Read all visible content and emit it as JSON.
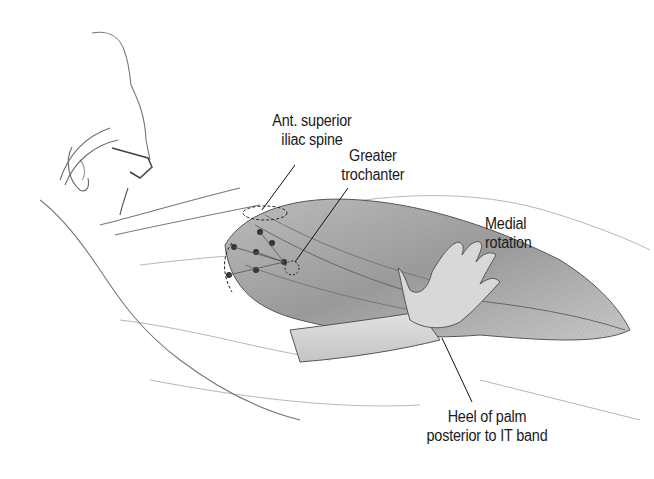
{
  "figure": {
    "labels": {
      "asis": {
        "line1": "Ant. superior",
        "line2": "iliac spine"
      },
      "trochanter": {
        "line1": "Greater",
        "line2": "trochanter"
      },
      "rotation": {
        "line1": "Medial",
        "line2": "rotation"
      },
      "heel": {
        "line1": "Heel of palm",
        "line2": "posterior to IT band"
      }
    }
  }
}
